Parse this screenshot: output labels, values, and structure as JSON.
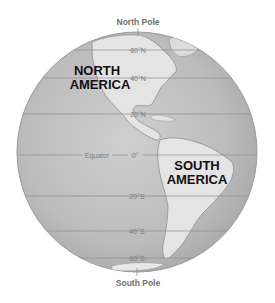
{
  "diagram": {
    "poles": {
      "north": "North Pole",
      "south": "South Pole"
    },
    "equator_label": "Equator",
    "latitudes": [
      {
        "label": "60°N",
        "y": 50
      },
      {
        "label": "40°N",
        "y": 78
      },
      {
        "label": "20°N",
        "y": 114
      },
      {
        "label": "0°",
        "y": 155
      },
      {
        "label": "20°S",
        "y": 196
      },
      {
        "label": "40°S",
        "y": 231
      },
      {
        "label": "60°S",
        "y": 258
      }
    ],
    "continents": {
      "north_america": [
        "NORTH",
        "AMERICA"
      ],
      "south_america": [
        "SOUTH",
        "AMERICA"
      ]
    },
    "colors": {
      "ocean": "#b9b9b9",
      "land": "#e4e4e4",
      "line": "#8c8c8c",
      "outline": "#9a9a9a"
    }
  }
}
